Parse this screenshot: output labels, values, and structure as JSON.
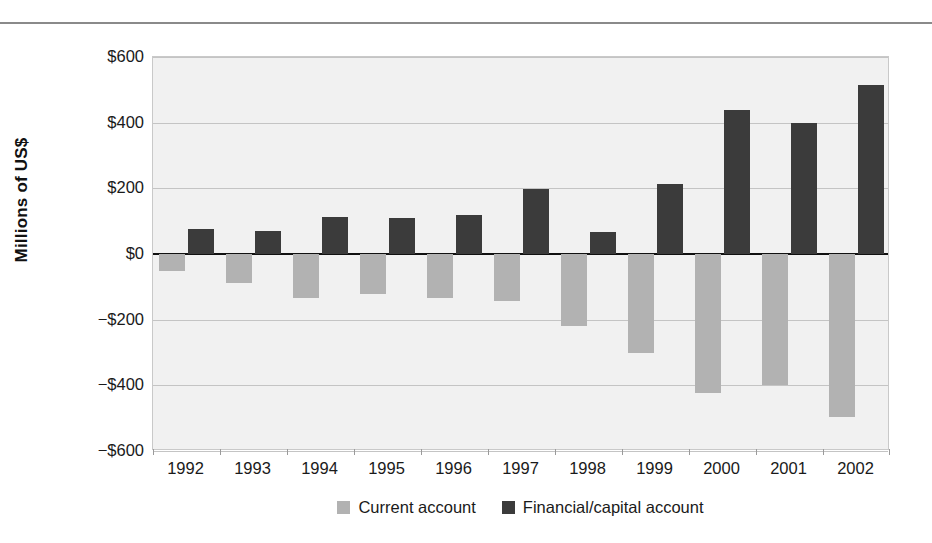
{
  "chart_data": {
    "type": "bar",
    "title": "",
    "subtitle": "",
    "xlabel": "",
    "ylabel": "Millions of US$",
    "ylim": [
      -600,
      600
    ],
    "ytick_values": [
      600,
      400,
      200,
      0,
      -200,
      -400,
      -600
    ],
    "ytick_labels": [
      "$600",
      "$400",
      "$200",
      "$0",
      "−$200",
      "−$400",
      "−$600"
    ],
    "grid": true,
    "legend_position": "bottom",
    "categories": [
      "1992",
      "1993",
      "1994",
      "1995",
      "1996",
      "1997",
      "1998",
      "1999",
      "2000",
      "2001",
      "2002"
    ],
    "series": [
      {
        "name": "Current account",
        "color": "#b2b2b2",
        "values": [
          -52,
          -88,
          -135,
          -123,
          -135,
          -142,
          -218,
          -303,
          -422,
          -400,
          -495
        ]
      },
      {
        "name": "Financial/capital account",
        "color": "#3b3b3b",
        "values": [
          77,
          70,
          113,
          110,
          120,
          198,
          67,
          212,
          440,
          400,
          515
        ]
      }
    ]
  },
  "legend": {
    "entries": [
      {
        "label": "Current account",
        "swatch": "current"
      },
      {
        "label": "Financial/capital account",
        "swatch": "financial"
      }
    ]
  },
  "colors": {
    "plot_background": "#f1f1f1",
    "gridline": "#c4c4c4",
    "zeroline": "#111111",
    "current_account": "#b2b2b2",
    "financial_capital_account": "#3b3b3b",
    "text": "#1a1a1a"
  }
}
